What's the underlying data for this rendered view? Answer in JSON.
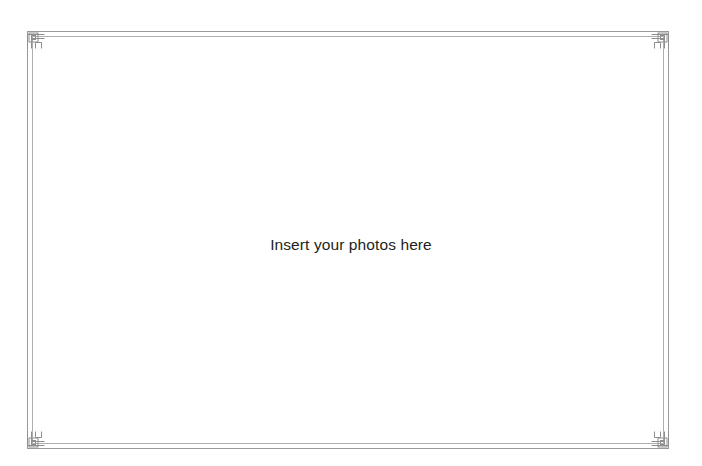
{
  "page": {
    "name": "photo-album-page",
    "width": 702,
    "height": 466,
    "background_color": "#ffffff",
    "aria_label": "Blank photo album page with decorative border"
  },
  "placeholder": {
    "text": "Insert your photos here",
    "text_color": "#231f20",
    "font_size_px": 15.5,
    "align": "center"
  },
  "frame": {
    "name": "decorative-double-rule-frame",
    "style": "double-rule with greek-key corner ornaments",
    "outer_rule_color": "#9a9a9a",
    "inner_rule_color": "#b0b0b0",
    "ornament_color": "#8e8e8e",
    "stroke_width_px": 1,
    "outer_rect": {
      "x": 27.5,
      "y": 31.5,
      "width": 641,
      "height": 417
    },
    "inner_rect": {
      "x": 32.5,
      "y": 36.5,
      "width": 631,
      "height": 407
    },
    "ornament_size_px": 17,
    "corners": [
      "top-left",
      "top-right",
      "bottom-left",
      "bottom-right"
    ]
  }
}
